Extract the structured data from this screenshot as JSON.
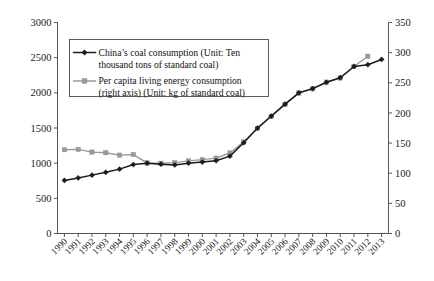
{
  "chart_data": {
    "type": "line",
    "title": "",
    "xlabel": "",
    "ylabel": "",
    "y2label": "",
    "grid": false,
    "legend_position": "upper-left-inside",
    "categories": [
      "1990",
      "1991",
      "1992",
      "1993",
      "1994",
      "1995",
      "1996",
      "1997",
      "1998",
      "1999",
      "2000",
      "2001",
      "2002",
      "2003",
      "2004",
      "2005",
      "2006",
      "2007",
      "2008",
      "2009",
      "2010",
      "2011",
      "2012",
      "2013"
    ],
    "ylim": [
      0,
      3000
    ],
    "yticks": [
      0,
      500,
      1000,
      1500,
      2000,
      2500,
      3000
    ],
    "y2lim": [
      0,
      350
    ],
    "y2ticks": [
      0,
      50,
      100,
      150,
      200,
      250,
      300,
      350
    ],
    "series": [
      {
        "name": "China's coal consumption (Unit: Ten thousand tons of standard coal)",
        "axis": "left",
        "color": "#1b1b1b",
        "marker": "diamond",
        "values": [
          755,
          790,
          830,
          870,
          915,
          980,
          1000,
          985,
          975,
          1000,
          1015,
          1035,
          1100,
          1290,
          1500,
          1670,
          1840,
          2000,
          2060,
          2150,
          2215,
          2375,
          2400,
          2475
        ]
      },
      {
        "name": "Per capita living energy consumption (right axis) (Unit: kg of standard coal)",
        "axis": "right",
        "color": "#9a9a9a",
        "marker": "square",
        "values": [
          139,
          139.5,
          135,
          134,
          130,
          131,
          117,
          116.5,
          117.5,
          120.5,
          122.5,
          125,
          133.5,
          152,
          174,
          194,
          214,
          233,
          240,
          251,
          258,
          277,
          294,
          null
        ]
      }
    ]
  },
  "legend": {
    "entries": [
      {
        "line1": "China’s coal consumption (Unit: Ten",
        "line2": "thousand tons of standard coal)"
      },
      {
        "line1": "Per capita living energy consumption",
        "line2": "(right axis) (Unit: kg of standard coal)"
      }
    ]
  },
  "axes": {
    "left_tick_labels": [
      "0",
      "500",
      "1000",
      "1500",
      "2000",
      "2500",
      "3000"
    ],
    "right_tick_labels": [
      "0",
      "50",
      "100",
      "150",
      "200",
      "250",
      "300",
      "350"
    ],
    "x_tick_labels": [
      "1990",
      "1991",
      "1992",
      "1993",
      "1994",
      "1995",
      "1996",
      "1997",
      "1998",
      "1999",
      "2000",
      "2001",
      "2002",
      "2003",
      "2004",
      "2005",
      "2006",
      "2007",
      "2008",
      "2009",
      "2010",
      "2011",
      "2012",
      "2013"
    ]
  },
  "colors": {
    "series_a": "#1b1b1b",
    "series_b": "#9a9a9a",
    "axis": "#555555",
    "text": "#111111",
    "background": "#ffffff"
  }
}
